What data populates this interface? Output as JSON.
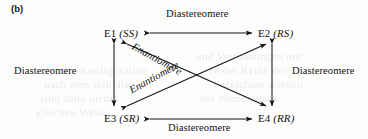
{
  "figure": {
    "caption_label": "(b)"
  },
  "nodes": [
    {
      "id": "E1",
      "code": "E1",
      "descriptor": "(SS)",
      "full": "E1 (SS)"
    },
    {
      "id": "E2",
      "code": "E2",
      "descriptor": "(RS)",
      "full": "E2 (RS)"
    },
    {
      "id": "E3",
      "code": "E3",
      "descriptor": "(SR)",
      "full": "E3 (SR)"
    },
    {
      "id": "E4",
      "code": "E4",
      "descriptor": "(RR)",
      "full": "E4 (RR)"
    }
  ],
  "edges": [
    {
      "id": "top",
      "from": "E1",
      "to": "E2",
      "label": "Diastereomere",
      "arrow": "double",
      "orientation": "horizontal"
    },
    {
      "id": "bottom",
      "from": "E3",
      "to": "E4",
      "label": "Diastereomere",
      "arrow": "double",
      "orientation": "horizontal"
    },
    {
      "id": "left",
      "from": "E1",
      "to": "E3",
      "label": "Diastereomere",
      "arrow": "double",
      "orientation": "vertical"
    },
    {
      "id": "right",
      "from": "E2",
      "to": "E4",
      "label": "Diastereomere",
      "arrow": "double",
      "orientation": "vertical"
    },
    {
      "id": "diag-upper",
      "from": "E1",
      "to": "E4",
      "label": "Enantiomere",
      "arrow": "double",
      "orientation": "diagonal"
    },
    {
      "id": "diag-lower",
      "from": "E3",
      "to": "E2",
      "label": "Enantiomere",
      "arrow": "double",
      "orientation": "diagonal"
    }
  ],
  "labels": {
    "top": "Diastereomere",
    "bottom": "Diastereomere",
    "left": "Diastereomere",
    "right": "Diastereomere",
    "diagonal_upper": "Enantiomere",
    "diagonal_lower": "Enantiomere"
  },
  "ghost_text": [
    {
      "text": "und Verbindungen mit",
      "x": 196,
      "y": 56
    },
    {
      "text": "hier die Konfiguration",
      "x": 40,
      "y": 70
    },
    {
      "text": "in der Reihe der",
      "x": 210,
      "y": 70
    },
    {
      "text": "nach dem sich die",
      "x": 44,
      "y": 84
    },
    {
      "text": "bezeichnet werden",
      "x": 214,
      "y": 84
    },
    {
      "text": "sind dann nicht",
      "x": 40,
      "y": 98
    },
    {
      "text": "der Nomenklatur",
      "x": 200,
      "y": 98
    },
    {
      "text": "gleichen Weise",
      "x": 36,
      "y": 112
    }
  ],
  "colors": {
    "ink": "#131313",
    "paper": "#fdfdfc",
    "ghost": "#6a6458"
  }
}
